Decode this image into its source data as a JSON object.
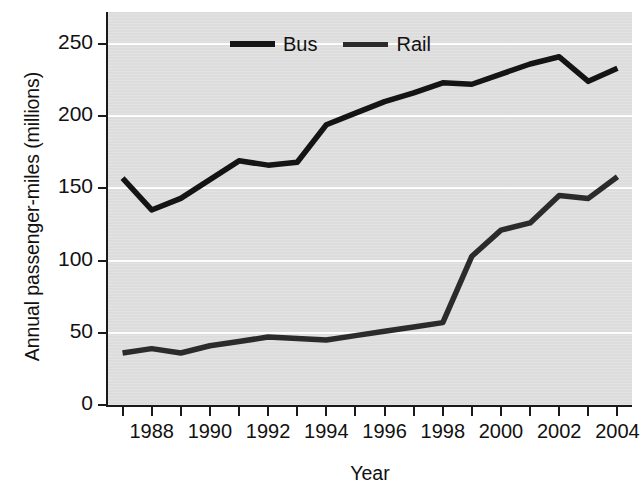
{
  "chart_data": {
    "type": "line",
    "title": "",
    "xlabel": "Year",
    "ylabel": "Annual passenger-miles (millions)",
    "x": [
      1987,
      1988,
      1989,
      1990,
      1991,
      1992,
      1993,
      1994,
      1995,
      1996,
      1997,
      1998,
      1999,
      2000,
      2001,
      2002,
      2003,
      2004
    ],
    "xticks": [
      1988,
      1990,
      1992,
      1994,
      1996,
      1998,
      2000,
      2002,
      2004
    ],
    "xtick_labels": [
      "1988",
      "1990",
      "1992",
      "1994",
      "1996",
      "1998",
      "2000",
      "2002",
      "2004"
    ],
    "yticks": [
      0,
      50,
      100,
      150,
      200,
      250
    ],
    "ytick_labels": [
      "0",
      "50",
      "100",
      "150",
      "200",
      "250"
    ],
    "xlim": [
      1986.5,
      2004.5
    ],
    "ylim": [
      0,
      272
    ],
    "grid": "horizontal-white",
    "legend_position": "top-left-inside",
    "series": [
      {
        "name": "Bus",
        "color": "#141414",
        "values": [
          157,
          135,
          143,
          156,
          169,
          166,
          168,
          194,
          202,
          210,
          216,
          223,
          222,
          229,
          236,
          241,
          224,
          233
        ]
      },
      {
        "name": "Rail",
        "color": "#2b2b2b",
        "values": [
          36,
          39,
          36,
          41,
          44,
          47,
          46,
          45,
          48,
          51,
          54,
          57,
          103,
          121,
          126,
          145,
          143,
          158
        ]
      }
    ],
    "plot_background": "#dfdfdf",
    "gridline_color": "#ffffff",
    "axis_color": "#1a1a1a"
  },
  "legend": {
    "items": [
      {
        "label": "Bus"
      },
      {
        "label": "Rail"
      }
    ]
  }
}
